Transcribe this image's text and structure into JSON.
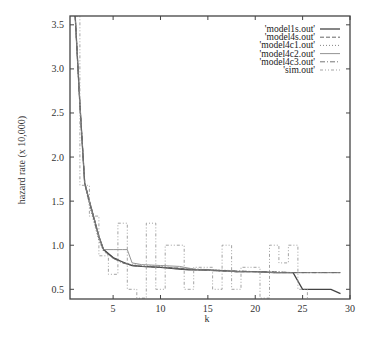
{
  "chart_data": {
    "type": "line",
    "title": "",
    "xlabel": "k",
    "ylabel": "hazard rate (x 10,000)",
    "xlim": [
      0.45,
      30
    ],
    "ylim": [
      0.39,
      3.6
    ],
    "xticks": [
      5,
      10,
      15,
      20,
      25,
      30
    ],
    "yticks": [
      0.5,
      1.0,
      1.5,
      2.0,
      2.5,
      3.0,
      3.5
    ],
    "xtick_labels": [
      "5",
      "10",
      "15",
      "20",
      "25",
      "30"
    ],
    "ytick_labels": [
      "0.5",
      "1.0",
      "1.5",
      "2.0",
      "2.5",
      "3.0",
      "3.5"
    ],
    "grid": false,
    "legend_position": "top-right",
    "series": [
      {
        "name": "'model1s.out'",
        "style": "solid",
        "color": "#444444",
        "x": [
          1,
          1.5,
          2,
          2.5,
          3,
          3.5,
          4,
          5,
          6,
          7,
          8,
          10,
          12,
          13,
          15,
          17,
          18,
          20,
          22,
          24,
          25,
          26,
          28,
          29
        ],
        "y": [
          3.6,
          2.6,
          1.7,
          1.5,
          1.3,
          1.1,
          0.95,
          0.86,
          0.81,
          0.77,
          0.76,
          0.75,
          0.73,
          0.72,
          0.72,
          0.71,
          0.7,
          0.7,
          0.69,
          0.69,
          0.5,
          0.5,
          0.5,
          0.45
        ]
      },
      {
        "name": "'model4s.out'",
        "style": "dashed",
        "color": "#555555",
        "x": [
          1,
          1.5,
          2,
          2.5,
          3,
          3.5,
          4,
          5,
          6,
          7,
          8,
          10,
          12,
          14,
          16,
          18,
          20,
          22,
          24,
          26,
          28,
          29
        ],
        "y": [
          3.6,
          2.6,
          1.72,
          1.5,
          1.3,
          1.1,
          0.95,
          0.86,
          0.81,
          0.77,
          0.76,
          0.75,
          0.74,
          0.72,
          0.71,
          0.7,
          0.7,
          0.69,
          0.69,
          0.69,
          0.69,
          0.69
        ]
      },
      {
        "name": "'model4c1.out'",
        "style": "dotted",
        "color": "#777777",
        "x": [
          1,
          1.5,
          2,
          2.5,
          3,
          3.5,
          4,
          5,
          6,
          7,
          8,
          10,
          12,
          14,
          16,
          18,
          20,
          22,
          24,
          26,
          28,
          29
        ],
        "y": [
          3.6,
          2.6,
          1.7,
          1.45,
          1.25,
          1.05,
          0.93,
          0.85,
          0.8,
          0.78,
          0.77,
          0.76,
          0.74,
          0.73,
          0.72,
          0.71,
          0.7,
          0.7,
          0.69,
          0.69,
          0.69,
          0.69
        ]
      },
      {
        "name": "'model4c2.out'",
        "style": "solid-light",
        "color": "#888888",
        "x": [
          1,
          1.5,
          2,
          2.5,
          3,
          3.5,
          4,
          5,
          6,
          6.5,
          7,
          8,
          10,
          12,
          14,
          16,
          18,
          20,
          22,
          24,
          26,
          28,
          29
        ],
        "y": [
          3.6,
          2.6,
          1.7,
          1.5,
          1.3,
          1.1,
          0.95,
          0.95,
          0.95,
          0.95,
          0.8,
          0.78,
          0.77,
          0.76,
          0.72,
          0.71,
          0.7,
          0.7,
          0.69,
          0.69,
          0.69,
          0.69,
          0.69
        ]
      },
      {
        "name": "'model4c3.out'",
        "style": "dash-dot",
        "color": "#666666",
        "x": [
          1,
          1.5,
          2,
          2.5,
          3,
          3.5,
          4,
          5,
          6,
          7,
          8,
          10,
          12,
          14,
          16,
          18,
          20,
          22,
          24,
          26,
          28,
          29
        ],
        "y": [
          3.6,
          2.6,
          1.7,
          1.48,
          1.28,
          1.08,
          0.94,
          0.85,
          0.8,
          0.77,
          0.76,
          0.75,
          0.73,
          0.72,
          0.71,
          0.71,
          0.7,
          0.7,
          0.69,
          0.69,
          0.69,
          0.69
        ]
      },
      {
        "name": "'sim.out'",
        "style": "dash-dot-dot",
        "color": "#999999",
        "x": [
          1.0,
          1.5,
          1.5,
          2.5,
          2.5,
          3.5,
          3.5,
          4.5,
          4.5,
          5.5,
          5.5,
          6.5,
          6.5,
          7.5,
          7.5,
          8.5,
          8.5,
          9.5,
          9.5,
          10.5,
          10.5,
          12.5,
          12.5,
          13.5,
          13.5,
          15.5,
          15.5,
          16.5,
          16.5,
          17.5,
          17.5,
          18.5,
          18.5,
          20.5,
          20.5,
          21.5,
          21.5,
          22.5,
          22.5,
          23.5,
          23.5,
          24.5,
          24.5,
          25.5,
          25.5
        ],
        "y": [
          3.6,
          3.6,
          1.68,
          1.68,
          1.33,
          1.33,
          0.88,
          0.88,
          0.67,
          0.67,
          1.25,
          1.25,
          0.5,
          0.5,
          0.4,
          0.4,
          1.25,
          1.25,
          0.5,
          0.5,
          1.0,
          1.0,
          0.5,
          0.5,
          0.75,
          0.75,
          0.5,
          0.5,
          1.0,
          1.0,
          0.5,
          0.5,
          0.75,
          0.75,
          0.4,
          0.4,
          1.0,
          1.0,
          0.8,
          0.8,
          1.0,
          1.0,
          0.5,
          0.5,
          0.4
        ]
      }
    ]
  }
}
